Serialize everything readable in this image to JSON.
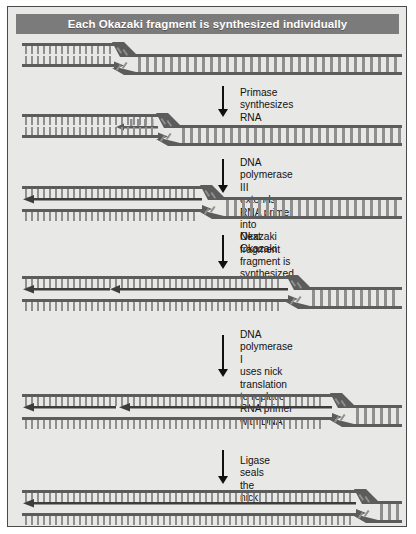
{
  "figure": {
    "title": "Each Okazaki fragment is synthesized individually",
    "background_color": "#e8e8e6",
    "title_bar_color": "#7b7b7b",
    "title_text_color": "#ffffff",
    "border_color": "#4a4a4a",
    "strand_color": "#5c5c5c",
    "base_color": "#8f8f8f",
    "arrow_color": "#101010"
  },
  "steps": [
    {
      "id": "primase",
      "label": "Primase\nsynthesizes RNA"
    },
    {
      "id": "pol3",
      "label": "DNA polymerase III\nextends RNA primer\ninto Okazaki fragment"
    },
    {
      "id": "next-frag",
      "label": "Next Okazaki\nfragment is\nsynthesized"
    },
    {
      "id": "pol1",
      "label": "DNA polymerase I\nuses nick translation\nto replace RNA primer\nwith DNA"
    },
    {
      "id": "ligase",
      "label": "Ligase seals the nick"
    }
  ],
  "panels": [
    {
      "id": "panel-1",
      "caption": "replication fork, no primer yet",
      "fork_x": 108
    },
    {
      "id": "panel-2",
      "caption": "RNA primer laid down on lagging strand",
      "fork_x": 152
    },
    {
      "id": "panel-3",
      "caption": "primer extended into Okazaki fragment",
      "fork_x": 196
    },
    {
      "id": "panel-4",
      "caption": "second Okazaki fragment synthesized",
      "fork_x": 282
    },
    {
      "id": "panel-5",
      "caption": "RNA primer replaced with DNA, nick left",
      "fork_x": 326
    },
    {
      "id": "panel-6",
      "caption": "nick sealed, lagging strand continuous",
      "fork_x": 350
    }
  ]
}
